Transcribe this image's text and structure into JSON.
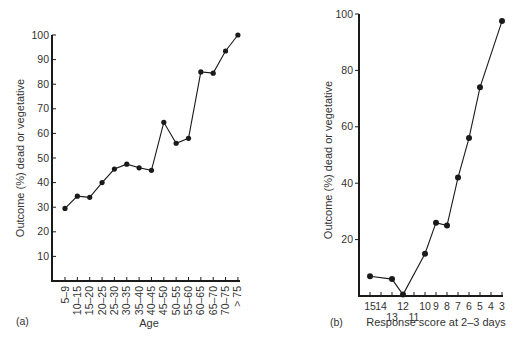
{
  "chart_data": [
    {
      "type": "line",
      "panel": "(a)",
      "title": "",
      "xlabel": "Age",
      "ylabel": "Outcome (%) dead or vegetative",
      "categories": [
        "5–9",
        "10–15",
        "15–20",
        "20–25",
        "25–30",
        "30–35",
        "35–40",
        "40–45",
        "45–50",
        "50–55",
        "55–60",
        "60–65",
        "65–70",
        "70–75",
        "> 75"
      ],
      "values": [
        29.5,
        34.5,
        34,
        40,
        45.5,
        47.5,
        46,
        45,
        64.5,
        56,
        58,
        85,
        84.5,
        93.5,
        100
      ],
      "yticks": [
        10,
        20,
        30,
        40,
        50,
        60,
        70,
        80,
        90,
        100
      ],
      "ylim": [
        0,
        100
      ],
      "grid": false,
      "legend": null
    },
    {
      "type": "line",
      "panel": "(b)",
      "title": "",
      "xlabel": "Response score at 2–3 days",
      "ylabel": "Outcome (%) dead or vegetative",
      "x_ticks": [
        15,
        14,
        13,
        12,
        11,
        10,
        9,
        8,
        7,
        6,
        5,
        4,
        3
      ],
      "x": [
        15,
        13,
        12,
        10,
        9,
        8,
        7,
        6,
        5,
        3
      ],
      "values": [
        7,
        6,
        0.5,
        15,
        26,
        25,
        42,
        56,
        74,
        97.5
      ],
      "yticks": [
        20,
        40,
        60,
        80,
        100
      ],
      "ylim": [
        0,
        100
      ],
      "grid": false,
      "legend": null
    }
  ],
  "panels": {
    "a": {
      "label": "(a)",
      "xlabel": "Age",
      "ylabel": "Outcome (%) dead or vegetative",
      "ytick_labels": [
        "10",
        "20",
        "30",
        "40",
        "50",
        "60",
        "70",
        "80",
        "90",
        "100"
      ]
    },
    "b": {
      "label": "(b)",
      "xlabel": "Response score at 2–3 days",
      "ylabel": "Outcome (%) dead or vegetative",
      "ytick_labels": [
        "20",
        "40",
        "60",
        "80",
        "100"
      ]
    }
  },
  "colors": {
    "line": "#1a1a1a",
    "text": "#333333",
    "background": "#ffffff"
  }
}
